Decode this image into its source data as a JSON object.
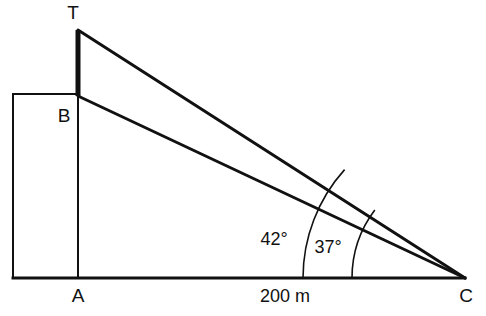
{
  "figure": {
    "type": "geometry-diagram",
    "background_color": "#ffffff",
    "stroke_color": "#111111",
    "width": 486,
    "height": 316
  },
  "points": {
    "T": {
      "label": "T",
      "x": 78,
      "y": 30,
      "label_x": 73,
      "label_y": 14
    },
    "B": {
      "label": "B",
      "x": 78,
      "y": 96,
      "label_x": 64,
      "label_y": 117
    },
    "A": {
      "label": "A",
      "x": 78,
      "y": 278,
      "label_x": 78,
      "label_y": 297
    },
    "C": {
      "label": "C",
      "x": 465,
      "y": 278,
      "label_x": 466,
      "label_y": 297
    }
  },
  "segments": {
    "tower_TB": {
      "name": "tower",
      "x1": 78,
      "y1": 30,
      "x2": 78,
      "y2": 96,
      "width": 5
    },
    "pole_BA": {
      "name": "building-right-edge",
      "x1": 78,
      "y1": 96,
      "x2": 78,
      "y2": 278,
      "width": 2
    },
    "sightline_TC": {
      "name": "line-of-sight-top",
      "x1": 78,
      "y1": 30,
      "x2": 465,
      "y2": 278,
      "width": 3
    },
    "sightline_BC": {
      "name": "line-of-sight-base",
      "x1": 78,
      "y1": 96,
      "x2": 465,
      "y2": 278,
      "width": 3
    },
    "ground_AC": {
      "name": "ground-line",
      "x1": 13,
      "y1": 278,
      "x2": 465,
      "y2": 278,
      "width": 3
    },
    "building_left": {
      "name": "building-left-edge",
      "x1": 13,
      "y1": 94,
      "x2": 13,
      "y2": 278,
      "width": 2
    },
    "building_top": {
      "name": "building-top-edge",
      "x1": 13,
      "y1": 94,
      "x2": 78,
      "y2": 94,
      "width": 2
    }
  },
  "angles": [
    {
      "id": "elevation-top",
      "label": "42°",
      "value": 42,
      "vertex": "C",
      "radius": 162,
      "label_x": 274,
      "label_y": 240
    },
    {
      "id": "elevation-base",
      "label": "37°",
      "value": 37,
      "vertex": "C",
      "radius": 113,
      "label_x": 328,
      "label_y": 248
    }
  ],
  "dimensions": [
    {
      "id": "ground-distance",
      "label": "200 m",
      "value": 200,
      "unit": "m",
      "from": "A",
      "to": "C",
      "label_x": 285,
      "label_y": 297
    }
  ]
}
